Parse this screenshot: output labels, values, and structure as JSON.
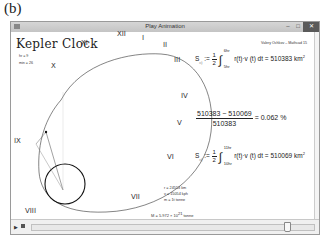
{
  "figure_label": "(b)",
  "window": {
    "title": "Play Animation",
    "buttons": {
      "minimize": "–",
      "maximize": "□",
      "close": "✕"
    }
  },
  "app": {
    "title": "Kepler Clock",
    "hr_label": "hr = 9",
    "min_label": "min = 26",
    "credit": "Valery Ochkov – Mathcad 15"
  },
  "clock_numerals": [
    "XII",
    "I",
    "II",
    "III",
    "IV",
    "V",
    "VI",
    "VII",
    "VIII",
    "IX",
    "X",
    "XI"
  ],
  "equations": {
    "eq1": {
      "lhs": "S",
      "lhs_sub": "◁",
      "assign": ":=",
      "frac_num": "1",
      "frac_den": "2",
      "upper": "6hr",
      "lower": "5hr",
      "integrand": "r(t)·v (t) dt",
      "result": "= 510383 km",
      "unit_sup": "2"
    },
    "ratio": {
      "numerator": "510383 − 510069",
      "denominator": "510383",
      "result": "= 0.062 %"
    },
    "eq2": {
      "lhs": "S",
      "lhs_sub": "◁",
      "assign": ":=",
      "frac_num": "1",
      "frac_den": "2",
      "upper": "11hr",
      "lower": "10hr",
      "integrand": "r(t)·v (t) dt",
      "result": "= 510069 km",
      "unit_sup": "2"
    }
  },
  "stats": {
    "r": "r = 24553 km",
    "v": "v = 15054 kph",
    "m": "m = 1t tonne",
    "M": "M = 5.972 × 10",
    "M_exp": "21",
    "M_unit": "tonne"
  },
  "player": {
    "play_icon": "▶",
    "stop_icon": "■",
    "slider_position_pct": 92
  }
}
